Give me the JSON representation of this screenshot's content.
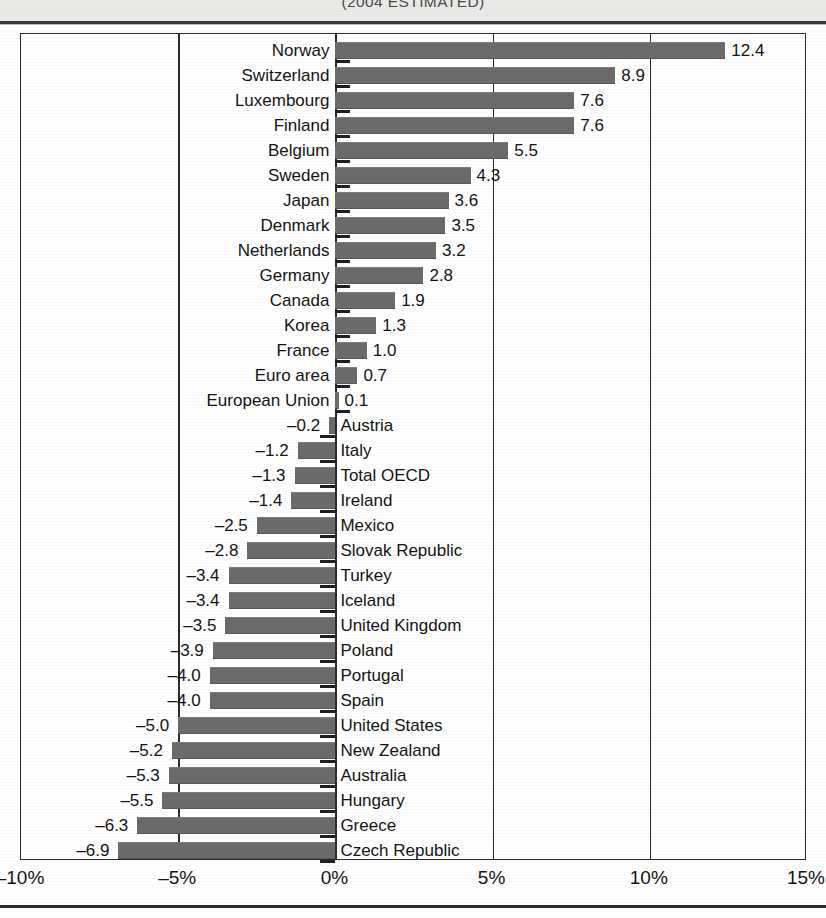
{
  "header": {
    "title": "(2004 ESTIMATED)"
  },
  "chart_data": {
    "type": "bar",
    "orientation": "horizontal",
    "title": "(2004 ESTIMATED)",
    "xlabel": "",
    "ylabel": "",
    "xlim": [
      -10,
      15
    ],
    "xticks": [
      "-10%",
      "-5%",
      "0%",
      "5%",
      "10%",
      "15%"
    ],
    "xtick_values": [
      -10,
      -5,
      0,
      5,
      10,
      15
    ],
    "grid": true,
    "legend": null,
    "bar_color": "#6b6b6b",
    "categories": [
      "Norway",
      "Switzerland",
      "Luxembourg",
      "Finland",
      "Belgium",
      "Sweden",
      "Japan",
      "Denmark",
      "Netherlands",
      "Germany",
      "Canada",
      "Korea",
      "France",
      "Euro area",
      "European Union",
      "Austria",
      "Italy",
      "Total OECD",
      "Ireland",
      "Mexico",
      "Slovak Republic",
      "Turkey",
      "Iceland",
      "United Kingdom",
      "Poland",
      "Portugal",
      "Spain",
      "United States",
      "New Zealand",
      "Australia",
      "Hungary",
      "Greece",
      "Czech Republic"
    ],
    "values": [
      12.4,
      8.9,
      7.6,
      7.6,
      5.5,
      4.3,
      3.6,
      3.5,
      3.2,
      2.8,
      1.9,
      1.3,
      1.0,
      0.7,
      0.1,
      -0.2,
      -1.2,
      -1.3,
      -1.4,
      -2.5,
      -2.8,
      -3.4,
      -3.4,
      -3.5,
      -3.9,
      -4.0,
      -4.0,
      -5.0,
      -5.2,
      -5.3,
      -5.5,
      -6.3,
      -6.9
    ],
    "value_labels": [
      "12.4",
      "8.9",
      "7.6",
      "7.6",
      "5.5",
      "4.3",
      "3.6",
      "3.5",
      "3.2",
      "2.8",
      "1.9",
      "1.3",
      "1.0",
      "0.7",
      "0.1",
      "–0.2",
      "–1.2",
      "–1.3",
      "–1.4",
      "–2.5",
      "–2.8",
      "–3.4",
      "–3.4",
      "–3.5",
      "–3.9",
      "–4.0",
      "–4.0",
      "–5.0",
      "–5.2",
      "–5.3",
      "–5.5",
      "–6.3",
      "–6.9"
    ]
  }
}
